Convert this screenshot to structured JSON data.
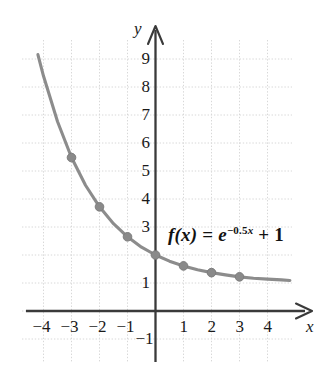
{
  "chart_data": {
    "type": "line",
    "title": "",
    "subtitle": "",
    "xlabel": "x",
    "ylabel": "y",
    "function_label": "f(x) = e^{-0.5x} + 1",
    "function_parts": {
      "name": "f",
      "arg": "(x)",
      "equals": "=",
      "base": "e",
      "exponent_sign": "−",
      "exponent_coef": "0.5",
      "exponent_var": "x",
      "plus": "+",
      "constant": "1"
    },
    "xlim": [
      -4.75,
      4.9
    ],
    "ylim": [
      -1.6,
      10.5
    ],
    "xticks": [
      -4,
      -3,
      -2,
      -1,
      1,
      2,
      3,
      4
    ],
    "xtick_labels": [
      "−4",
      "−3",
      "−2",
      "−1",
      "1",
      "2",
      "3",
      "4"
    ],
    "yticks": [
      -1,
      1,
      3,
      4,
      5,
      6,
      7,
      8,
      9
    ],
    "ytick_labels": [
      "−1",
      "1",
      "3",
      "4",
      "5",
      "6",
      "7",
      "8",
      "9"
    ],
    "grid": true,
    "grid_style": "dotted",
    "grid_color": "#d8d8d8",
    "axis_color": "#3a3a3a",
    "curve_color": "#8c8c8c",
    "marker_color": "#8a8a8a",
    "legend": "none",
    "asymptote": 1,
    "series": [
      {
        "name": "f(x) = e^{-0.5x} + 1",
        "x": [
          -3,
          -2,
          -1,
          0,
          1,
          2,
          3
        ],
        "y": [
          5.48,
          3.72,
          2.65,
          2.0,
          1.61,
          1.37,
          1.22
        ]
      }
    ],
    "curve_samples": {
      "x": [
        -4.2,
        -4,
        -3.5,
        -3,
        -2.5,
        -2,
        -1.5,
        -1,
        -0.5,
        0,
        0.5,
        1,
        1.5,
        2,
        2.5,
        3,
        3.5,
        4,
        4.5,
        4.8
      ],
      "y": [
        9.16,
        8.39,
        6.77,
        5.48,
        4.49,
        3.72,
        3.12,
        2.65,
        2.28,
        2.0,
        1.78,
        1.61,
        1.47,
        1.37,
        1.29,
        1.22,
        1.17,
        1.14,
        1.11,
        1.09
      ]
    }
  },
  "axis_labels": {
    "x_name": "x",
    "y_name": "y"
  }
}
